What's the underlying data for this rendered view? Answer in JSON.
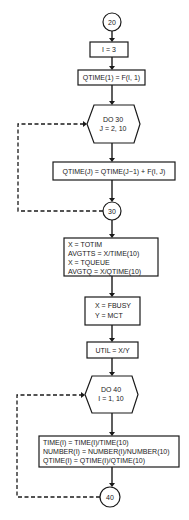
{
  "flowchart": {
    "connector_20": "20",
    "init_i": "I = 3",
    "qtime1": "QTIME(1) = F(I, 1)",
    "loop30": {
      "line1": "DO 30",
      "line2": "J = 2, 10"
    },
    "qtimej": "QTIME(J) = QTIME(J−1) + F(I, J)",
    "connector_30": "30",
    "averages": [
      "X = TOTIM",
      "AVGTTS = X/TIME(10)",
      "X = TQUEUE",
      "AVGTQ = X/QTIME(10)"
    ],
    "busy": [
      "X = FBUSY",
      "Y = MCT"
    ],
    "util": "UTIL = X/Y",
    "loop40": {
      "line1": "DO 40",
      "line2": "I = 1, 10"
    },
    "normalize": [
      "TIME(I) = TIME(I)/TIME(10)",
      "NUMBER(I) = NUMBER(I)/NUMBER(10)",
      "QTIME(I) = QTIME(I)/QTIME(10)"
    ],
    "connector_40": "40"
  },
  "colors": {
    "line": "#1a1a1a",
    "background": "#ffffff"
  }
}
